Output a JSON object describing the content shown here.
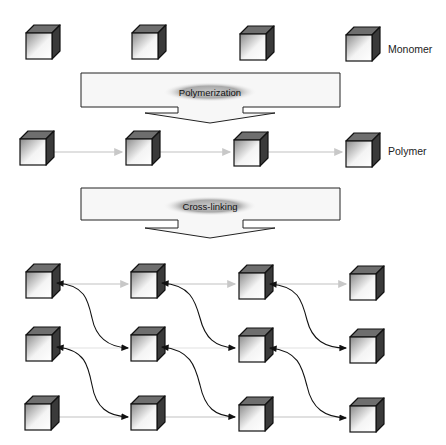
{
  "labels": {
    "monomer": "Monomer",
    "polymer": "Polymer"
  },
  "steps": [
    {
      "label": "Polymerization"
    },
    {
      "label": "Cross-linking"
    }
  ],
  "colors": {
    "cube_top": "#6e6e6e",
    "cube_side": "#3a3a3a",
    "cube_face_light": "#ffffff",
    "cube_face_dark": "#9a9a9a",
    "chain_link": "#d0d0d0",
    "crosslink": "#222222",
    "arrow_fill": "#f7f7f7",
    "ellipse": "#888888"
  },
  "rows": {
    "monomer": {
      "count": 4
    },
    "polymer": {
      "count": 4
    },
    "network": {
      "rows": 3,
      "cols": 4
    }
  }
}
